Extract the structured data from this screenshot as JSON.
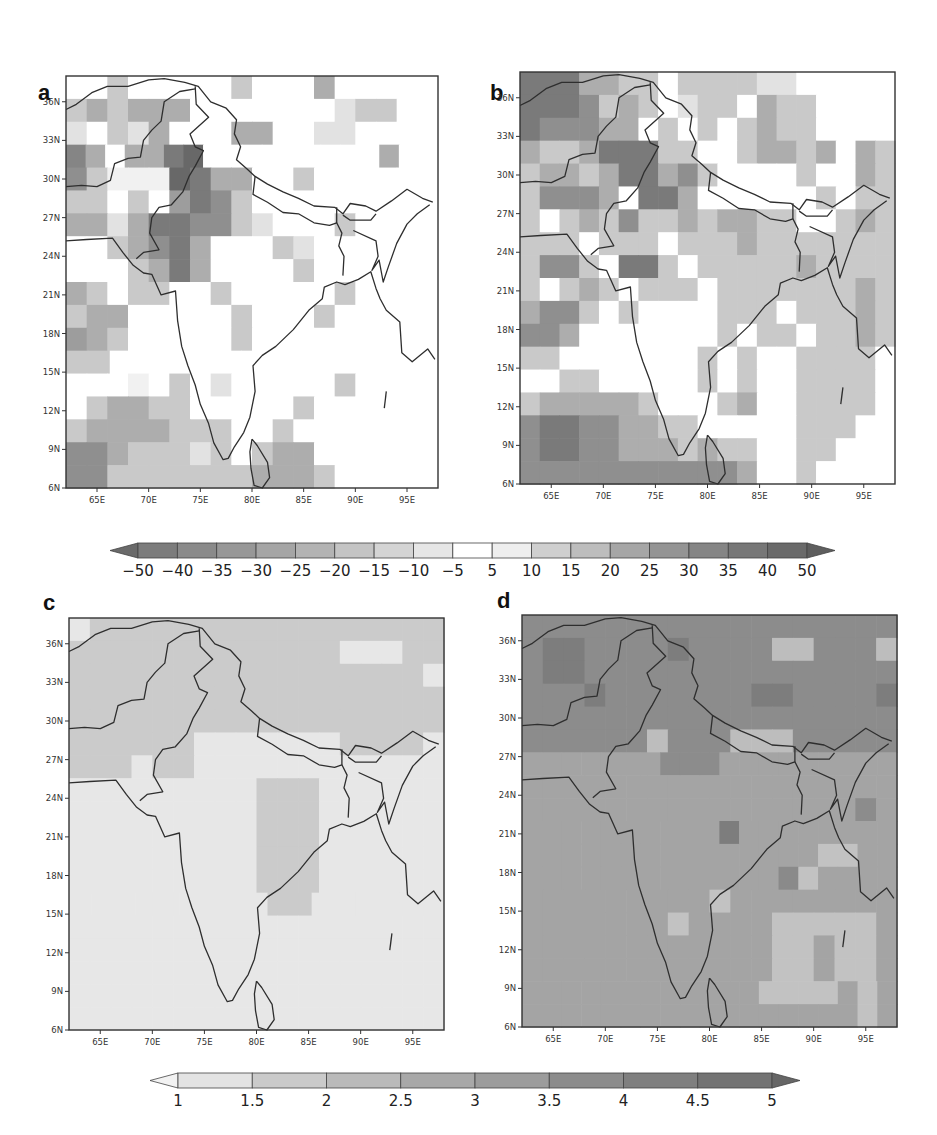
{
  "panels": [
    {
      "id": "a",
      "label": "a"
    },
    {
      "id": "b",
      "label": "b"
    },
    {
      "id": "c",
      "label": "c"
    },
    {
      "id": "d",
      "label": "d"
    }
  ],
  "axes": {
    "lat_ticks": [
      "6N",
      "9N",
      "12N",
      "15N",
      "18N",
      "21N",
      "24N",
      "27N",
      "30N",
      "33N",
      "36N"
    ],
    "lon_ticks": [
      "65E",
      "70E",
      "75E",
      "80E",
      "85E",
      "90E",
      "95E"
    ]
  },
  "colorbar_top": {
    "labels": [
      "-50",
      "-40",
      "-35",
      "-30",
      "-25",
      "-20",
      "-15",
      "-10",
      "-5",
      "5",
      "10",
      "15",
      "20",
      "25",
      "30",
      "35",
      "40",
      "50"
    ],
    "colors": [
      "#6a6a6a",
      "#7c7c7c",
      "#8a8a8a",
      "#979797",
      "#a5a5a5",
      "#b3b3b3",
      "#c4c4c4",
      "#d4d4d4",
      "#e6e6e6",
      "#ffffff",
      "#eeeeee",
      "#cfcfcf",
      "#bdbdbd",
      "#a6a6a6",
      "#949494",
      "#858585",
      "#777777",
      "#6a6a6a",
      "#5e5e5e"
    ]
  },
  "colorbar_bottom": {
    "labels": [
      "1",
      "1.5",
      "2",
      "2.5",
      "3",
      "3.5",
      "4",
      "4.5",
      "5"
    ],
    "colors": [
      "#f2f2f2",
      "#e3e3e3",
      "#cacaca",
      "#bababa",
      "#a8a8a8",
      "#9c9c9c",
      "#8c8c8c",
      "#7f7f7f",
      "#737373",
      "#666666"
    ]
  },
  "chart_data": [
    {
      "type": "heatmap",
      "title": "a",
      "xlabel": "Longitude",
      "ylabel": "Latitude",
      "xlim": [
        62,
        98
      ],
      "ylim": [
        6,
        38
      ],
      "x_ticks": [
        "65E",
        "70E",
        "75E",
        "80E",
        "85E",
        "90E",
        "95E"
      ],
      "y_ticks": [
        "6N",
        "9N",
        "12N",
        "15N",
        "18N",
        "21N",
        "24N",
        "27N",
        "30N",
        "33N",
        "36N"
      ],
      "colorbar": [
        "-50",
        "-40",
        "-35",
        "-30",
        "-25",
        "-20",
        "-15",
        "-10",
        "-5",
        "5",
        "10",
        "15",
        "20",
        "25",
        "30",
        "35",
        "40",
        "50"
      ],
      "grid": false,
      "description": "Percentage change map: negative (grey) values concentrated over NW India/Pakistan (30-34N, 68-76E down to -40), Arabian Sea west coast (6-12N), mostly near zero over central/east India"
    },
    {
      "type": "heatmap",
      "title": "b",
      "xlabel": "Longitude",
      "ylabel": "Latitude",
      "xlim": [
        62,
        98
      ],
      "ylim": [
        6,
        38
      ],
      "x_ticks": [
        "65E",
        "70E",
        "75E",
        "80E",
        "85E",
        "90E",
        "95E"
      ],
      "y_ticks": [
        "6N",
        "9N",
        "12N",
        "15N",
        "18N",
        "21N",
        "24N",
        "27N",
        "30N",
        "33N",
        "36N"
      ],
      "colorbar": [
        "-50",
        "-40",
        "-35",
        "-30",
        "-25",
        "-20",
        "-15",
        "-10",
        "-5",
        "5",
        "10",
        "15",
        "20",
        "25",
        "30",
        "35",
        "40",
        "50"
      ],
      "grid": false,
      "description": "Percentage change map: stronger magnitude than (a); dark values over NW (33-37N, 62-75E), Gujarat (~23N, 70E), southern Arabian Sea/Indian Ocean (6-11N); moderate grey over eastern India and Bay of Bengal"
    },
    {
      "type": "heatmap",
      "title": "c",
      "xlabel": "Longitude",
      "ylabel": "Latitude",
      "xlim": [
        62,
        98
      ],
      "ylim": [
        6,
        38
      ],
      "x_ticks": [
        "65E",
        "70E",
        "75E",
        "80E",
        "85E",
        "90E",
        "95E"
      ],
      "y_ticks": [
        "6N",
        "9N",
        "12N",
        "15N",
        "18N",
        "21N",
        "24N",
        "27N",
        "30N",
        "33N",
        "36N"
      ],
      "colorbar": [
        "1",
        "1.5",
        "2",
        "2.5",
        "3",
        "3.5",
        "4",
        "4.5",
        "5"
      ],
      "grid": false,
      "description": "Values mostly 1-1.5 over peninsular India and oceans; 1.5-2 over north (north of ~27-30N) and central India block (17-26N, 78-83E)"
    },
    {
      "type": "heatmap",
      "title": "d",
      "xlabel": "Longitude",
      "ylabel": "Latitude",
      "xlim": [
        62,
        98
      ],
      "ylim": [
        6,
        38
      ],
      "x_ticks": [
        "65E",
        "70E",
        "75E",
        "80E",
        "85E",
        "90E",
        "95E"
      ],
      "y_ticks": [
        "6N",
        "9N",
        "12N",
        "15N",
        "18N",
        "21N",
        "24N",
        "27N",
        "30N",
        "33N",
        "36N"
      ],
      "colorbar": [
        "1",
        "1.5",
        "2",
        "2.5",
        "3",
        "3.5",
        "4",
        "4.5",
        "5"
      ],
      "grid": false,
      "description": "Values mostly 3-3.5 over south; 3.5-4.5 over north (north of ~26N); lighter 2-3 patches over Bay of Bengal (8-18N, 85-95E)"
    }
  ],
  "grids": {
    "a": [
      "..c.....c...d.....",
      "cdcddd.......bcc..",
      "b.cbd...dd..bb....",
      "Bd.ddEF.........d..",
      "DcaaaFEdd..c......",
      "cc.c.CEDc.........",
      "ddbdEEDDcb...c....",
      "..cdDEd...cb......",
      "...cdEd....c......",
      "dc.cc..c.....c....",
      "cdd.....c...c.....",
      "Cdc.....c.........",
      "cc...............",
      "...a.c.b.....c....",
      ".cddcc.....c......",
      "cddddccc..c.......",
      "DDdcccbc.cdd......",
      "DDcccccccdddc....."
    ],
    "b": [
      "EEEddcc.ccccbb.....",
      "EEEDcdc.bcc.dcc....",
      "EDDDdd.c.c.cdcc....",
      "dccdEEEcc..cddcd.dc",
      "cddcdEEdDc....c..dc",
      "cDDDd.EEd......c.cc",
      "c.cdcDccdcddcc..cdc",
      "ccc.ccc.cccdccccccc",
      "cDDc.EEc.cccccdcccc",
      "c.cdc.ccc.cccccccdc",
      "dDDc.c....ccc.cccdc",
      "DDd.......c.cc.ccdc",
      "cc.......c.c..cccc.",
      "..cc.....c.c..cccc.",
      "cdddddc...cd..cccc.",
      "DEEDDddcc.....ccc..",
      "DEEDDdddcdcc..cc...",
      "DDDDDDDDDDDd..c...."
    ],
    "c": [
      "pqqqqqqqqqqqqqqqqq",
      "qqqqqqqqqqqqqpppqq",
      "qqqqqqqqqqqqqqqqqp",
      "qqqqqqqqqqqqqqqqqq",
      "qqqqqqqqqqqqqqqqqq",
      "qqqqqqpppppppqqqqp",
      "qqqpqqpppppppppppp",
      "pppppppppqqqpppppp",
      "pppppppppqqqpppppp",
      "pppppppppqqqpppppp",
      "pppppppppqqqpppppp",
      "pppppppppqqqpppppp",
      "pppppppppqqpppppp",
      "pppppppppppppppppp",
      "pppppppppppppppppp",
      "pppppppppppppppppp",
      "pppppppppppppppppp",
      "pppppppppppppppppp"
    ],
    "d": [
      "vvvvvvvvvvvvvvvvvv",
      "vwwvvvvwvvvvuuvvvu",
      "vwwvvvvvvvvvvvvvvv",
      "vvvwvvvvvvvwwvvvvw",
      "vvvvvvvvvvvvvvvvvv",
      "vvvvvvuvvvuuuvvvvv",
      "tttttttvvvttttttttt",
      "tttttttttttttttttt",
      "ttttttttttttttttvt",
      "ttttttttttwtttttttt",
      "tttttttttttttttrrtt",
      "tttttttttttttsrtttt",
      "tttttttttrtttttttt",
      "tttttttrttttrrrrrt",
      "ttttttttttttrrtrrt",
      "ttttttttttttrrtrrt",
      "ttttttttttttrrrrtrt",
      "tttttttttttttttttrt"
    ]
  },
  "palette": {
    ".": "#ffffff",
    "a": "#f1f1f1",
    "b": "#e2e2e2",
    "c": "#c9c9c9",
    "d": "#adadad",
    "D": "#8f8f8f",
    "E": "#7a7a7a",
    "F": "#686868",
    "C": "#9d9d9d",
    "B": "#858585",
    "p": "#e7e7e7",
    "q": "#cbcbcb",
    "r": "#c2c2c2",
    "s": "#8a8a8a",
    "t": "#a4a4a4",
    "u": "#bdbdbd",
    "v": "#8c8c8c",
    "w": "#7d7d7d"
  }
}
